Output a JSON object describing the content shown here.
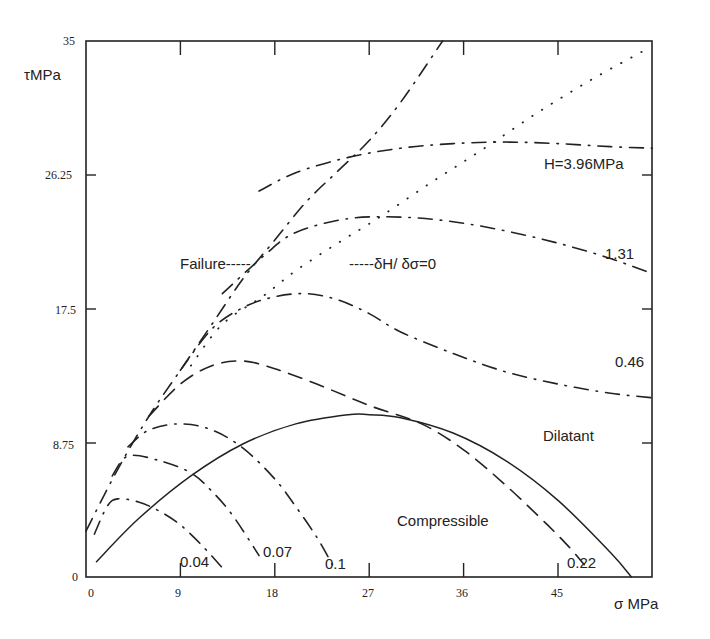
{
  "chart_data": {
    "type": "line",
    "title": "",
    "xlabel": "σ MPa",
    "ylabel": "τMPa",
    "xlim": [
      0,
      54
    ],
    "ylim": [
      0,
      35
    ],
    "x_ticks": [
      "0",
      "9",
      "18",
      "27",
      "36",
      "45"
    ],
    "y_ticks": [
      "0",
      "8.75",
      "17.5",
      "26.25",
      "35"
    ],
    "grid": false,
    "legend": null,
    "annotations": {
      "failure": "Failure-----",
      "zero_line": "-----δH/ δσ=0",
      "dilatant": "Dilatant",
      "compressible": "Compressible"
    },
    "series": [
      {
        "name": "δH/δσ=0",
        "style": "solid",
        "x": [
          1,
          5,
          10,
          15,
          20,
          25,
          27,
          30,
          35,
          40,
          45,
          50,
          52
        ],
        "y": [
          1,
          3.8,
          6.6,
          8.7,
          10.0,
          10.6,
          10.6,
          10.4,
          9.4,
          7.6,
          5.0,
          1.6,
          0
        ]
      },
      {
        "name": "Failure",
        "style": "dashdot",
        "x": [
          0,
          3,
          6,
          9,
          12,
          15,
          18,
          21,
          24,
          27,
          30,
          34
        ],
        "y": [
          3,
          7,
          10.5,
          13.5,
          16.5,
          19.5,
          22,
          24.5,
          26.5,
          28.5,
          31,
          35
        ]
      },
      {
        "name": "H=3.96MPa",
        "label": "H=3.96MPa",
        "style": "dashdot",
        "x": [
          16.5,
          20,
          25,
          30,
          35,
          40,
          45,
          50,
          54
        ],
        "y": [
          25.2,
          26.4,
          27.4,
          28.0,
          28.3,
          28.4,
          28.3,
          28.1,
          28.0
        ]
      },
      {
        "name": "1.31",
        "label": "1.31",
        "style": "dashdot",
        "x": [
          13,
          17,
          20,
          25,
          30,
          35,
          40,
          45,
          50,
          54
        ],
        "y": [
          18.5,
          21.0,
          22.5,
          23.4,
          23.5,
          23.2,
          22.6,
          21.8,
          20.8,
          19.8
        ]
      },
      {
        "name": "0.46",
        "label": "0.46",
        "style": "dashdot",
        "x": [
          9,
          12,
          15,
          18,
          21,
          24,
          27,
          30,
          35,
          40,
          45,
          50,
          54
        ],
        "y": [
          13.5,
          16.2,
          17.6,
          18.3,
          18.5,
          18.1,
          17.2,
          16.0,
          14.6,
          13.4,
          12.6,
          12.0,
          11.7
        ]
      },
      {
        "name": "0.22",
        "label": "0.22",
        "style": "dashed",
        "x": [
          6,
          9,
          12,
          15,
          18,
          22,
          27,
          32,
          36,
          40,
          44,
          46,
          47.5
        ],
        "y": [
          10.5,
          12.6,
          13.8,
          14.1,
          13.6,
          12.6,
          11.2,
          10.0,
          8.3,
          6.0,
          3.4,
          2.0,
          0.8
        ]
      },
      {
        "name": "0.1",
        "label": "0.1",
        "style": "dashdot",
        "x": [
          4,
          6,
          9,
          12,
          15,
          18,
          20,
          22,
          23.5
        ],
        "y": [
          8.5,
          9.6,
          10.0,
          9.6,
          8.4,
          6.4,
          4.6,
          2.6,
          0.8
        ]
      },
      {
        "name": "0.07",
        "label": "0.07",
        "style": "dashdot",
        "x": [
          2.5,
          4,
          7,
          10,
          12,
          14,
          16.5
        ],
        "y": [
          6.6,
          7.9,
          7.6,
          6.8,
          5.6,
          4.0,
          1.4
        ]
      },
      {
        "name": "0.04",
        "label": "0.04",
        "style": "dashdot",
        "x": [
          0.8,
          2,
          3,
          5,
          7,
          9,
          11,
          13
        ],
        "y": [
          2.8,
          4.6,
          5.1,
          4.9,
          4.3,
          3.4,
          2.1,
          0.6
        ]
      }
    ]
  },
  "labels": {
    "y_axis": "τMPa",
    "x_axis": "σ MPa",
    "failure": "Failure-----",
    "zero_line": "-----δH/ δσ=0",
    "dilatant": "Dilatant",
    "compressible": "Compressible",
    "h396": "H=3.96MPa",
    "c131": "1.31",
    "c046": "0.46",
    "c022": "0.22",
    "c01": "0.1",
    "c007": "0.07",
    "c004": "0.04"
  },
  "ticks": {
    "x": [
      "0",
      "9",
      "18",
      "27",
      "36",
      "45"
    ],
    "y": [
      "0",
      "8.75",
      "17.5",
      "26.25",
      "35"
    ]
  }
}
